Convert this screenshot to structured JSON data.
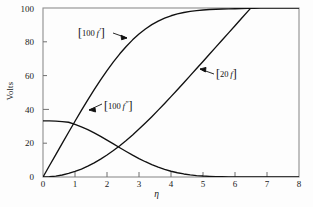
{
  "chart_data": {
    "type": "line",
    "title": "",
    "xlabel": "η",
    "ylabel": "Volts",
    "xlim": [
      0,
      8
    ],
    "ylim": [
      0,
      100
    ],
    "grid": false,
    "legend_position": "inline-annotations",
    "xticks": [
      "0",
      "1",
      "2",
      "3",
      "4",
      "5",
      "6",
      "7",
      "8"
    ],
    "yticks": [
      "0",
      "20",
      "40",
      "60",
      "80",
      "100"
    ],
    "x": [
      0,
      0.2,
      0.4,
      0.6,
      0.8,
      1.0,
      1.2,
      1.4,
      1.6,
      1.8,
      2.0,
      2.2,
      2.4,
      2.6,
      2.8,
      3.0,
      3.2,
      3.4,
      3.6,
      3.8,
      4.0,
      4.2,
      4.4,
      4.6,
      4.8,
      5.0,
      5.2,
      5.4,
      5.6,
      5.8,
      6.0,
      6.2,
      6.4,
      6.6,
      6.8,
      7.0,
      7.2,
      7.4,
      7.6,
      7.8,
      8.0
    ],
    "series": [
      {
        "name": "[100 f′]",
        "label_text": "100 f′",
        "color": "#111111",
        "values": [
          0.0,
          6.64,
          13.28,
          19.89,
          26.47,
          32.98,
          39.38,
          45.63,
          51.68,
          57.48,
          62.98,
          68.13,
          72.9,
          77.25,
          81.15,
          84.6,
          87.59,
          90.13,
          92.26,
          94.0,
          95.4,
          96.5,
          97.35,
          98.0,
          98.48,
          98.83,
          99.09,
          99.27,
          99.4,
          99.49,
          99.55,
          99.68,
          99.78,
          99.85,
          99.9,
          99.93,
          99.96,
          99.97,
          99.98,
          99.99,
          100.0
        ]
      },
      {
        "name": "[100 f″]",
        "label_text": "100 f″",
        "color": "#111111",
        "values": [
          33.21,
          33.19,
          33.05,
          32.74,
          32.39,
          31.12,
          29.67,
          27.98,
          26.08,
          24.01,
          21.81,
          19.56,
          17.29,
          15.07,
          12.92,
          10.9,
          9.03,
          7.33,
          5.81,
          4.51,
          3.4,
          2.51,
          1.8,
          1.26,
          0.86,
          0.57,
          0.37,
          0.23,
          0.14,
          0.08,
          0.05,
          0.03,
          0.02,
          0.01,
          0.01,
          0.0,
          0.0,
          0.0,
          0.0,
          0.0,
          0.0
        ]
      },
      {
        "name": "[20 f]",
        "label_text": "20 f",
        "color": "#111111",
        "values": [
          0.0,
          0.13,
          0.53,
          1.19,
          2.12,
          3.3,
          4.73,
          6.43,
          8.37,
          10.56,
          12.99,
          15.65,
          18.53,
          21.62,
          24.9,
          28.35,
          31.95,
          35.7,
          39.56,
          43.52,
          47.56,
          51.65,
          55.8,
          59.97,
          64.17,
          68.38,
          72.6,
          76.82,
          81.05,
          85.28,
          89.51,
          93.75,
          97.98,
          102.2,
          106.4,
          110.6,
          114.8,
          119.0,
          123.2,
          127.4,
          131.6
        ]
      }
    ],
    "annotations": [
      {
        "name": "label-100-fprime",
        "bracket_open": "[",
        "number": "100",
        "fn": "f",
        "prime": "′",
        "bracket_close": "]",
        "arrow": "from label rightward-down to 100 f′ curve"
      },
      {
        "name": "label-20-f",
        "bracket_open": "[",
        "number": "20",
        "fn": "f",
        "prime": "",
        "bracket_close": "]",
        "arrow": "from label leftward-up to 20 f line"
      },
      {
        "name": "label-100-fdoubleprime",
        "bracket_open": "[",
        "number": "100",
        "fn": "f",
        "prime": "″",
        "bracket_close": "]",
        "arrow": "from label leftward-down to 100 f″ curve"
      }
    ]
  },
  "axes": {
    "ylabel": "Volts",
    "xlabel": "η",
    "yticks": [
      "100",
      "80",
      "60",
      "40",
      "20",
      "0"
    ],
    "xticks": [
      "0",
      "1",
      "2",
      "3",
      "4",
      "5",
      "6",
      "7",
      "8"
    ]
  },
  "colors": {
    "curve": "#111111",
    "frame": "#8c8c8c",
    "background": "#fdfdfd",
    "text": "#1a1a1a"
  }
}
